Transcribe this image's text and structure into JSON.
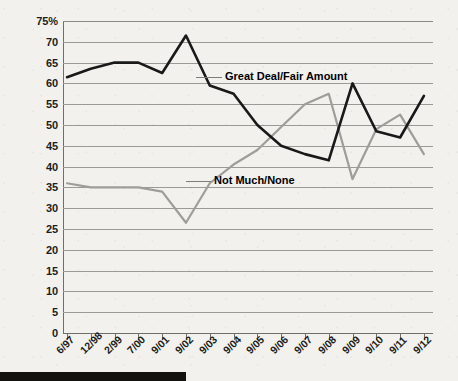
{
  "chart_data": {
    "type": "line",
    "title": "",
    "subtitle": "",
    "xlabel": "",
    "ylabel": "",
    "ylim": [
      0,
      75
    ],
    "xlim_categories": true,
    "grid": true,
    "legend": "inline-annotations",
    "y_ticks": [
      "75%",
      "70",
      "65",
      "60",
      "55",
      "50",
      "45",
      "40",
      "35",
      "30",
      "25",
      "20",
      "15",
      "10",
      "5",
      "0"
    ],
    "y_tick_values": [
      75,
      70,
      65,
      60,
      55,
      50,
      45,
      40,
      35,
      30,
      25,
      20,
      15,
      10,
      5,
      0
    ],
    "categories": [
      "6/97",
      "12/98",
      "2/99",
      "7/00",
      "9/01",
      "9/02",
      "9/03",
      "9/04",
      "9/05",
      "9/06",
      "9/07",
      "9/08",
      "9/09",
      "9/10",
      "9/11",
      "9/12"
    ],
    "series": [
      {
        "name": "Great Deal/Fair Amount",
        "color": "#191919",
        "values": [
          61.5,
          63.5,
          65,
          65,
          62.5,
          71.5,
          59.5,
          57.5,
          50,
          45,
          43,
          41.5,
          60,
          48.5,
          47,
          57
        ]
      },
      {
        "name": "Not Much/None",
        "color": "#9d9d99",
        "values": [
          36,
          35,
          35,
          35,
          34,
          26.5,
          36,
          40.5,
          44,
          49.5,
          55,
          57.5,
          37,
          49,
          52.5,
          43
        ]
      }
    ],
    "annotations": [
      {
        "label": "Great Deal/Fair Amount",
        "series": "Great Deal/Fair Amount"
      },
      {
        "label": "Not Much/None",
        "series": "Not Much/None"
      }
    ]
  },
  "colors": {
    "background": "#f2f1ee",
    "grid": "#9a9a96",
    "axis": "#6e6e6a",
    "series_dark": "#191919",
    "series_light": "#9d9d99",
    "bottom_bar": "#14120f",
    "text": "#1d1d1b"
  }
}
